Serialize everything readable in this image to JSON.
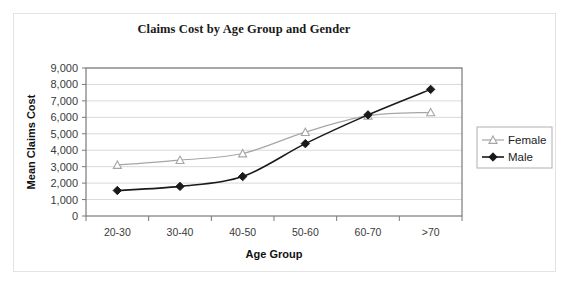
{
  "chart_data": {
    "type": "line",
    "title": "Claims Cost by Age Group and Gender",
    "xlabel": "Age Group",
    "ylabel": "Mean Claims Cost",
    "categories": [
      "20-30",
      "30-40",
      "40-50",
      "50-60",
      "60-70",
      ">70"
    ],
    "series": [
      {
        "name": "Female",
        "values": [
          3100,
          3400,
          3800,
          5100,
          6100,
          6300
        ],
        "color": "#a6a6a6",
        "marker": "triangle-open"
      },
      {
        "name": "Male",
        "values": [
          1550,
          1800,
          2400,
          4400,
          6150,
          7700
        ],
        "color": "#1a1a1a",
        "marker": "diamond-filled"
      }
    ],
    "ylim": [
      0,
      9000
    ],
    "ytick_values": [
      0,
      1000,
      2000,
      3000,
      4000,
      5000,
      6000,
      7000,
      8000,
      9000
    ],
    "ytick_labels": [
      "0",
      "1,000",
      "2,000",
      "3,000",
      "4,000",
      "5,000",
      "6,000",
      "7,000",
      "8,000",
      "9,000"
    ],
    "grid": "horizontal",
    "legend_position": "right",
    "smoothed": true
  },
  "legend": {
    "entries": [
      {
        "label": "Female"
      },
      {
        "label": "Male"
      }
    ]
  },
  "colors": {
    "female": "#a6a6a6",
    "male": "#1a1a1a",
    "gridline": "#d9d9d9",
    "axis": "#7a7a7a",
    "frame_border": "#e3e3e3"
  }
}
